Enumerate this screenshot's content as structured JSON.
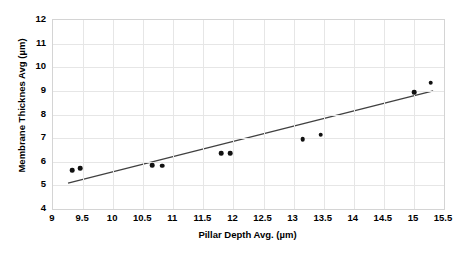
{
  "chart_data": {
    "type": "scatter",
    "title": "",
    "xlabel": "Pillar Depth Avg. (µm)",
    "ylabel": "Membrane Thicknes Avg (µm)",
    "xlim": [
      9,
      15.5
    ],
    "ylim": [
      4,
      12
    ],
    "xticks": [
      9,
      9.5,
      10,
      10.5,
      11,
      11.5,
      12,
      12.5,
      13,
      13.5,
      14,
      14.5,
      15,
      15.5
    ],
    "xtick_labels": [
      "9",
      "9.5",
      "10",
      "10.5",
      "11",
      "11.5",
      "12",
      "12.5",
      "13",
      "13.5",
      "14",
      "14.5",
      "15",
      "15.5"
    ],
    "yticks": [
      4,
      5,
      6,
      7,
      8,
      9,
      10,
      11,
      12
    ],
    "ytick_labels": [
      "4",
      "5",
      "6",
      "7",
      "8",
      "9",
      "10",
      "11",
      "12"
    ],
    "grid": true,
    "grid_color": "#e6e6e6",
    "legend": false,
    "legend_position": "none",
    "marker_color": "#111111",
    "marker_shape": "circle",
    "trendline_color": "#404040",
    "series": [
      {
        "name": "Membrane Thickness vs Pillar Depth",
        "points": [
          {
            "x": 9.32,
            "y": 5.65
          },
          {
            "x": 9.45,
            "y": 5.72
          },
          {
            "x": 10.65,
            "y": 5.85
          },
          {
            "x": 10.82,
            "y": 5.83
          },
          {
            "x": 11.8,
            "y": 6.35
          },
          {
            "x": 11.95,
            "y": 6.35
          },
          {
            "x": 13.15,
            "y": 6.95
          },
          {
            "x": 13.45,
            "y": 7.15
          },
          {
            "x": 15.0,
            "y": 8.95
          },
          {
            "x": 15.28,
            "y": 9.35
          }
        ]
      }
    ],
    "trendline": {
      "type": "linear",
      "x_start": 9.25,
      "y_start": 5.1,
      "x_end": 15.32,
      "y_end": 9.0
    }
  }
}
